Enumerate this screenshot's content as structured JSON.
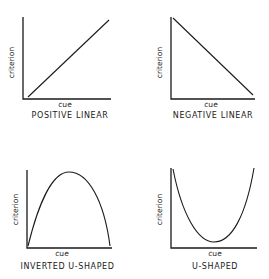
{
  "panels": [
    {
      "id": "positive-linear",
      "title": "POSITIVE LINEAR",
      "xlabel": "cue",
      "ylabel": "criterion",
      "shape": "line",
      "trend": "increasing"
    },
    {
      "id": "negative-linear",
      "title": "NEGATIVE LINEAR",
      "xlabel": "cue",
      "ylabel": "criterion",
      "shape": "line",
      "trend": "decreasing"
    },
    {
      "id": "inverted-u-shaped",
      "title": "INVERTED U-SHAPED",
      "xlabel": "cue",
      "ylabel": "criterion",
      "shape": "curve",
      "trend": "rises then falls (peak near middle)"
    },
    {
      "id": "u-shaped",
      "title": "U-SHAPED",
      "xlabel": "cue",
      "ylabel": "criterion",
      "shape": "curve",
      "trend": "falls then rises (minimum near middle)"
    }
  ],
  "colors": {
    "ink": "#1a1a1a",
    "background": "#ffffff"
  }
}
